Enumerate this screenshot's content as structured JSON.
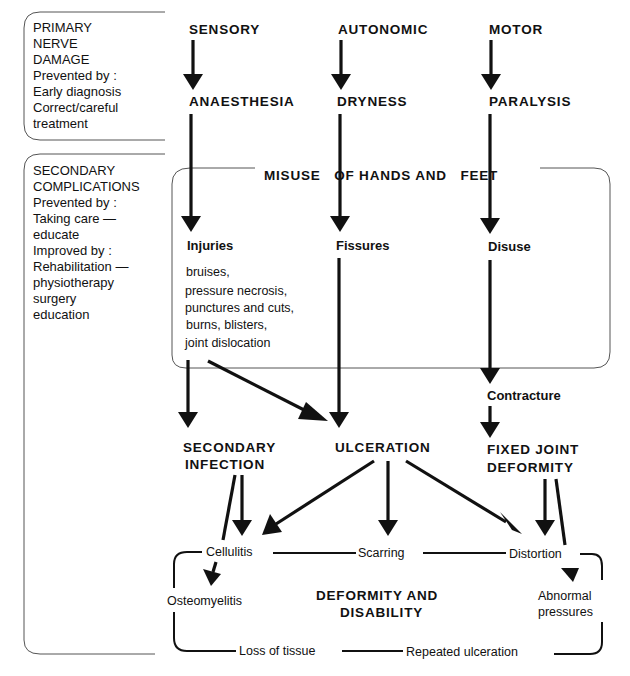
{
  "primary_box": {
    "title_lines": [
      "PRIMARY",
      "NERVE",
      "DAMAGE"
    ],
    "prevented_label": "Prevented by :",
    "prevention_lines": [
      "Early diagnosis",
      "Correct/careful",
      "treatment"
    ]
  },
  "secondary_box": {
    "title_lines": [
      "SECONDARY",
      "COMPLICATIONS"
    ],
    "prevented_label": "Prevented by :",
    "prevention_lines": [
      "Taking care —",
      "educate"
    ],
    "improved_label": "Improved by :",
    "improvement_lines": [
      "Rehabilitation —",
      "physiotherapy",
      "surgery",
      "education"
    ]
  },
  "columns": {
    "sensory": {
      "nerve": "SENSORY",
      "effect": "ANAESTHESIA",
      "misuse": "Injuries"
    },
    "autonomic": {
      "nerve": "AUTONOMIC",
      "effect": "DRYNESS",
      "misuse": "Fissures"
    },
    "motor": {
      "nerve": "MOTOR",
      "effect": "PARALYSIS",
      "misuse": "Disuse"
    }
  },
  "misuse_box": {
    "title": "MISUSE   OF HANDS AND   FEET",
    "injury_list": [
      "bruises,",
      "pressure necrosis,",
      "punctures and cuts,",
      "burns, blisters,",
      "joint dislocation"
    ]
  },
  "intermediate": {
    "contracture": "Contracture"
  },
  "outcomes": {
    "secondary_infection": [
      "SECONDARY",
      "INFECTION"
    ],
    "ulceration": "ULCERATION",
    "fixed_joint_deformity": [
      "FIXED JOINT",
      "DEFORMITY"
    ]
  },
  "deformity_cycle": {
    "title_lines": [
      "DEFORMITY AND",
      "DISABILITY"
    ],
    "nodes": {
      "cellulitis": "Cellulitis",
      "scarring": "Scarring",
      "distortion": "Distortion",
      "osteomyelitis": "Osteomyelitis",
      "abnormal_pressures": [
        "Abnormal",
        "pressures"
      ],
      "loss_of_tissue": "Loss of tissue",
      "repeated_ulceration": "Repeated ulceration"
    }
  }
}
